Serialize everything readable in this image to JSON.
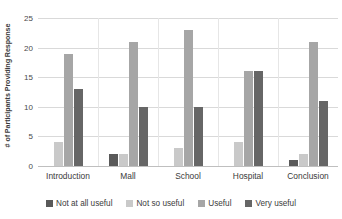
{
  "chart_data": {
    "type": "bar",
    "title": "",
    "subtitle": "",
    "xlabel": "",
    "ylabel": "# of Participants Providing Response",
    "ylim": [
      0,
      25
    ],
    "ytick_labels": [
      "25",
      "20",
      "15",
      "10",
      "5",
      "0"
    ],
    "ytick_values": [
      25,
      20,
      15,
      10,
      5,
      0
    ],
    "grid": true,
    "legend_position": "bottom",
    "categories": [
      "Introduction",
      "Mall",
      "School",
      "Hospital",
      "Conclusion"
    ],
    "series": [
      {
        "name": "Not at all useful",
        "color": "#595959",
        "values": [
          0,
          2,
          0,
          0,
          1
        ]
      },
      {
        "name": "Not so useful",
        "color": "#c9c9c9",
        "values": [
          4,
          2,
          3,
          4,
          2
        ]
      },
      {
        "name": "Useful",
        "color": "#a6a6a6",
        "values": [
          19,
          21,
          23,
          16,
          21
        ]
      },
      {
        "name": "Very useful",
        "color": "#666666",
        "values": [
          13,
          10,
          10,
          16,
          11
        ]
      }
    ]
  }
}
